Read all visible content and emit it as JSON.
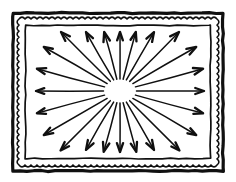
{
  "figure": {
    "canvas": {
      "width": 236,
      "height": 182,
      "background": "#ffffff"
    },
    "ink_color": "#101010",
    "frame": {
      "name": "decorative-border",
      "outer_rect": {
        "x": 13,
        "y": 13,
        "width": 210,
        "height": 158,
        "stroke_width": 3.2
      },
      "scallop_rect": {
        "x": 19,
        "y": 19,
        "width": 198,
        "height": 146,
        "stroke_width": 1.6,
        "wave_amplitude": 1.9,
        "wave_period": 6.0
      },
      "inner_rect": {
        "x": 25.5,
        "y": 25.5,
        "width": 185,
        "height": 133,
        "stroke_width": 1.7
      }
    },
    "burst": {
      "name": "radial-arrow-burst",
      "center": {
        "x": 120,
        "y": 91
      },
      "core_ellipse": {
        "rx": 15,
        "ry": 10.5
      },
      "arrow_count": 24,
      "line_width": 1.5,
      "head_length": 9.5,
      "head_half_angle_deg": 19,
      "arrows": [
        {
          "angle_deg": 0,
          "start_r": 16,
          "end_r": 84
        },
        {
          "angle_deg": 15,
          "start_r": 16,
          "end_r": 86
        },
        {
          "angle_deg": 30,
          "start_r": 16,
          "end_r": 88
        },
        {
          "angle_deg": 45,
          "start_r": 16,
          "end_r": 84
        },
        {
          "angle_deg": 60,
          "start_r": 15,
          "end_r": 68
        },
        {
          "angle_deg": 75,
          "start_r": 14,
          "end_r": 63
        },
        {
          "angle_deg": 90,
          "start_r": 13,
          "end_r": 62
        },
        {
          "angle_deg": 105,
          "start_r": 14,
          "end_r": 63
        },
        {
          "angle_deg": 120,
          "start_r": 15,
          "end_r": 68
        },
        {
          "angle_deg": 135,
          "start_r": 16,
          "end_r": 84
        },
        {
          "angle_deg": 150,
          "start_r": 16,
          "end_r": 88
        },
        {
          "angle_deg": 165,
          "start_r": 16,
          "end_r": 86
        },
        {
          "angle_deg": 180,
          "start_r": 16,
          "end_r": 84
        },
        {
          "angle_deg": 195,
          "start_r": 16,
          "end_r": 86
        },
        {
          "angle_deg": 210,
          "start_r": 16,
          "end_r": 88
        },
        {
          "angle_deg": 225,
          "start_r": 16,
          "end_r": 84
        },
        {
          "angle_deg": 240,
          "start_r": 15,
          "end_r": 68
        },
        {
          "angle_deg": 255,
          "start_r": 14,
          "end_r": 63
        },
        {
          "angle_deg": 270,
          "start_r": 13,
          "end_r": 62
        },
        {
          "angle_deg": 285,
          "start_r": 14,
          "end_r": 63
        },
        {
          "angle_deg": 300,
          "start_r": 15,
          "end_r": 68
        },
        {
          "angle_deg": 315,
          "start_r": 16,
          "end_r": 84
        },
        {
          "angle_deg": 330,
          "start_r": 16,
          "end_r": 88
        },
        {
          "angle_deg": 345,
          "start_r": 16,
          "end_r": 86
        }
      ]
    }
  }
}
